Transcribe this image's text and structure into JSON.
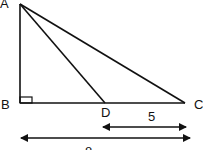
{
  "diagram": {
    "type": "right-triangle",
    "points": {
      "A": {
        "label": "A",
        "x": 20,
        "y": 4
      },
      "B": {
        "label": "B",
        "x": 20,
        "y": 103
      },
      "D": {
        "label": "D",
        "x": 105,
        "y": 103
      },
      "C": {
        "label": "C",
        "x": 185,
        "y": 103
      }
    },
    "segments": [
      "AB",
      "BC",
      "AC",
      "AD"
    ],
    "right_angle_at": "B",
    "dimensions": [
      {
        "name": "DC",
        "label": "5"
      },
      {
        "name": "BC",
        "label": "8"
      }
    ],
    "stroke_color": "#111111"
  }
}
